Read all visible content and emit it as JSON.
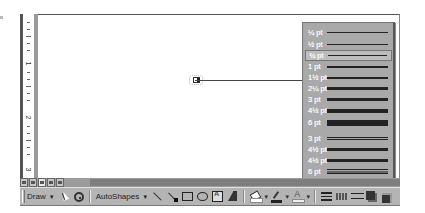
{
  "ruler": {
    "numbers": [
      "1",
      "2",
      "3"
    ]
  },
  "line_style_menu": {
    "items": [
      {
        "label": "¼ pt",
        "weight": 1,
        "style": "single"
      },
      {
        "label": "½ pt",
        "weight": 1,
        "style": "single"
      },
      {
        "label": "¾ pt",
        "weight": 1,
        "style": "single",
        "selected": true
      },
      {
        "label": "1 pt",
        "weight": 2,
        "style": "single"
      },
      {
        "label": "1½ pt",
        "weight": 2,
        "style": "single"
      },
      {
        "label": "2¼ pt",
        "weight": 3,
        "style": "single"
      },
      {
        "label": "3 pt",
        "weight": 4,
        "style": "single"
      },
      {
        "label": "4½ pt",
        "weight": 5,
        "style": "single"
      },
      {
        "label": "6 pt",
        "weight": 7,
        "style": "single"
      },
      {
        "label": "3 pt",
        "weight": 3,
        "style": "double"
      },
      {
        "label": "4½ pt",
        "weight": 4,
        "style": "double"
      },
      {
        "label": "4½ pt",
        "weight": 4,
        "style": "double"
      },
      {
        "label": "6 pt",
        "weight": 5,
        "style": "triple"
      }
    ],
    "more_lines": "More Lines..."
  },
  "view_buttons": [
    "normal-view",
    "web-layout-view",
    "print-layout-view",
    "outline-view",
    "reading-view"
  ],
  "drawing_toolbar": {
    "draw_label": "Draw",
    "autoshapes_label": "AutoShapes",
    "tools": [
      "select-objects",
      "free-rotate",
      "line",
      "arrow",
      "rectangle",
      "oval",
      "text-box",
      "insert-wordart",
      "fill-color",
      "line-color",
      "font-color",
      "line-style",
      "dash-style",
      "arrow-style",
      "shadow",
      "3d"
    ]
  },
  "colors": {
    "menu_bg": "#a9a9a9",
    "toolbar_bg": "#b4b4b4",
    "page_bg": "#ffffff"
  }
}
